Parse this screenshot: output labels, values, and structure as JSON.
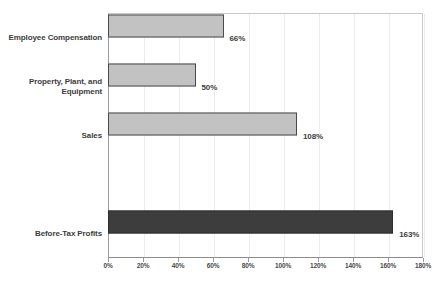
{
  "chart_data": {
    "type": "bar",
    "orientation": "horizontal",
    "title": "",
    "xlabel": "",
    "ylabel": "",
    "categories": [
      "Employee Compensation",
      "Property, Plant, and Equipment",
      "Sales",
      "",
      "Before-Tax Profits"
    ],
    "values": [
      66,
      50,
      108,
      null,
      163
    ],
    "value_labels": [
      "66%",
      "50%",
      "108%",
      "",
      "163%"
    ],
    "xlim": [
      0,
      180
    ],
    "xtick_labels": [
      "0%",
      "20%",
      "40%",
      "60%",
      "80%",
      "100%",
      "120%",
      "140%",
      "160%",
      "180%"
    ],
    "xticks": [
      0,
      20,
      40,
      60,
      80,
      100,
      120,
      140,
      160,
      180
    ],
    "grid": true,
    "legend": false,
    "bar_colors": [
      "#c2c2c2",
      "#c2c2c2",
      "#c2c2c2",
      "#c2c2c2",
      "#3d3d3d"
    ],
    "bar_border_color": "#4a4a4a",
    "gridline_color": "#ececec",
    "axis_color": "#8c8c8c",
    "text_color": "#3d3d3d",
    "background": "#ffffff"
  }
}
